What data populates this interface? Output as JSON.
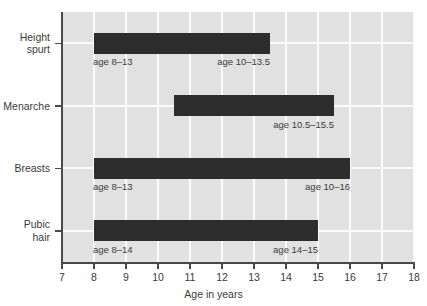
{
  "chart_data": {
    "type": "bar",
    "orientation": "horizontal",
    "title": "",
    "subtitle": "",
    "xlabel": "Age in years",
    "ylabel": "",
    "xlim": [
      7,
      18
    ],
    "ylim": [
      0,
      4
    ],
    "grid": true,
    "grid_color": "#fbfbfb",
    "plot_background": "#e1e1e1",
    "bar_color": "#2d2d2d",
    "legend": null,
    "legend_position": "none",
    "x_ticks": [
      "7",
      "8",
      "9",
      "10",
      "11",
      "12",
      "13",
      "14",
      "15",
      "16",
      "17",
      "18"
    ],
    "x_tick_values": [
      7,
      8,
      9,
      10,
      11,
      12,
      13,
      14,
      15,
      16,
      17,
      18
    ],
    "categories": [
      "Height spurt",
      "Menarche",
      "Breasts",
      "Pubic hair"
    ],
    "category_labels": [
      "Height\nspurt",
      "Menarche",
      "Breasts",
      "Pubic\nhair"
    ],
    "bars": [
      {
        "category": "Height spurt",
        "label": "Height\nspurt",
        "start": 8,
        "end": 13.5,
        "start_annotation": "age 8–13",
        "end_annotation": "age 10–13.5"
      },
      {
        "category": "Menarche",
        "label": "Menarche",
        "start": 10.5,
        "end": 15.5,
        "start_annotation": "",
        "end_annotation": "age 10.5–15.5"
      },
      {
        "category": "Breasts",
        "label": "Breasts",
        "start": 8,
        "end": 16,
        "start_annotation": "age 8–13",
        "end_annotation": "age 10–16"
      },
      {
        "category": "Pubic hair",
        "label": "Pubic\nhair",
        "start": 8,
        "end": 15,
        "start_annotation": "age 8–14",
        "end_annotation": "age 14–15"
      }
    ],
    "annotations": [
      "age 8–13",
      "age 10–13.5",
      "age 10.5–15.5",
      "age 8–13",
      "age 10–16",
      "age 8–14",
      "age 14–15"
    ]
  }
}
